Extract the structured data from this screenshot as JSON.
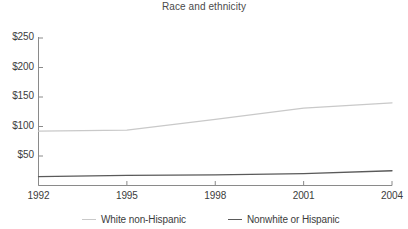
{
  "chart_data": {
    "type": "line",
    "title": "Race and ethnicity",
    "xlabel": "",
    "ylabel": "",
    "x": [
      1992,
      1995,
      1998,
      2001,
      2004
    ],
    "xlim": [
      1992,
      2004
    ],
    "ylim": [
      0,
      250
    ],
    "xticks": [
      "1992",
      "1995",
      "1998",
      "2001",
      "2004"
    ],
    "yticks": [
      "$50",
      "$100",
      "$150",
      "$200",
      "$250"
    ],
    "ytick_values": [
      50,
      100,
      150,
      200,
      250
    ],
    "grid": false,
    "legend_position": "bottom",
    "series": [
      {
        "name": "White non-Hispanic",
        "color": "#c9c9c9",
        "values": [
          92,
          94,
          112,
          131,
          140
        ]
      },
      {
        "name": "Nonwhite or Hispanic",
        "color": "#5a5a5a",
        "values": [
          15,
          17,
          18,
          20,
          25
        ]
      }
    ]
  },
  "axis": {
    "y_labels": [
      {
        "text": "$250",
        "value": 250
      },
      {
        "text": "$200",
        "value": 200
      },
      {
        "text": "$150",
        "value": 150
      },
      {
        "text": "$100",
        "value": 100
      },
      {
        "text": "$50",
        "value": 50
      }
    ],
    "x_labels": [
      {
        "text": "1992",
        "value": 1992
      },
      {
        "text": "1995",
        "value": 1995
      },
      {
        "text": "1998",
        "value": 1998
      },
      {
        "text": "2001",
        "value": 2001
      },
      {
        "text": "2004",
        "value": 2004
      }
    ]
  },
  "legend": {
    "items": [
      {
        "label": "White non-Hispanic",
        "color": "#c9c9c9"
      },
      {
        "label": "Nonwhite or Hispanic",
        "color": "#5a5a5a"
      }
    ]
  }
}
